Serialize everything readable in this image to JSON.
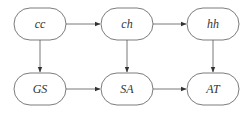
{
  "diagram": {
    "type": "flow",
    "colors": {
      "background": "#ffffff",
      "stroke": "#5a5a5a",
      "arrow": "#333333",
      "text": "#333333"
    },
    "nodes": [
      {
        "id": "cc",
        "label": "cc",
        "row": 0,
        "col": 0
      },
      {
        "id": "ch",
        "label": "ch",
        "row": 0,
        "col": 1
      },
      {
        "id": "hh",
        "label": "hh",
        "row": 0,
        "col": 2
      },
      {
        "id": "GS",
        "label": "GS",
        "row": 1,
        "col": 0
      },
      {
        "id": "SA",
        "label": "SA",
        "row": 1,
        "col": 1
      },
      {
        "id": "AT",
        "label": "AT",
        "row": 1,
        "col": 2
      }
    ],
    "edges": [
      {
        "from": "cc",
        "to": "ch"
      },
      {
        "from": "ch",
        "to": "hh"
      },
      {
        "from": "cc",
        "to": "GS"
      },
      {
        "from": "ch",
        "to": "SA"
      },
      {
        "from": "hh",
        "to": "AT"
      },
      {
        "from": "GS",
        "to": "SA"
      },
      {
        "from": "SA",
        "to": "AT"
      }
    ]
  }
}
